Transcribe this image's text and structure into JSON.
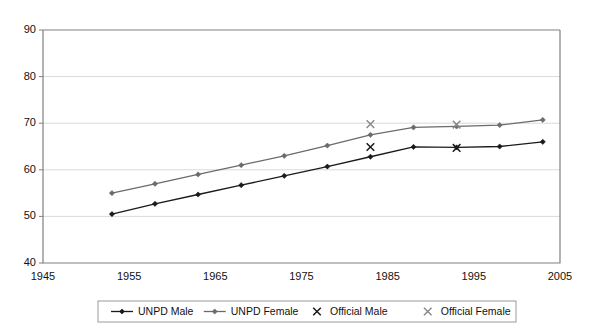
{
  "chart_data": {
    "type": "line",
    "title": "",
    "subtitle": "",
    "xlabel": "",
    "ylabel": "",
    "xlim": [
      1945,
      2005
    ],
    "ylim": [
      40,
      90
    ],
    "xticks": [
      1945,
      1955,
      1965,
      1975,
      1985,
      1995,
      2005
    ],
    "yticks": [
      40,
      50,
      60,
      70,
      80,
      90
    ],
    "grid": "horizontal",
    "legend_position": "bottom",
    "series": [
      {
        "name": "UNPD Male",
        "marker": "diamond",
        "color": "#1a1a1a",
        "style": "line+marker",
        "x": [
          1953,
          1958,
          1963,
          1968,
          1973,
          1978,
          1983,
          1988,
          1993,
          1998,
          2003
        ],
        "values": [
          50.5,
          52.7,
          54.7,
          56.7,
          58.7,
          60.7,
          62.8,
          64.9,
          64.8,
          65.0,
          66.0
        ]
      },
      {
        "name": "UNPD Female",
        "marker": "diamond",
        "color": "#6b6b6b",
        "style": "line+marker",
        "x": [
          1953,
          1958,
          1963,
          1968,
          1973,
          1978,
          1983,
          1988,
          1993,
          1998,
          2003
        ],
        "values": [
          55.0,
          57.0,
          59.0,
          61.0,
          63.0,
          65.2,
          67.5,
          69.1,
          69.3,
          69.6,
          70.7
        ]
      },
      {
        "name": "Official Male",
        "marker": "x",
        "color": "#1a1a1a",
        "style": "marker-only",
        "x": [
          1983,
          1993
        ],
        "values": [
          64.9,
          64.7
        ]
      },
      {
        "name": "Official Female",
        "marker": "x",
        "color": "#8a8a8a",
        "style": "marker-only",
        "x": [
          1983,
          1993
        ],
        "values": [
          69.8,
          69.7
        ]
      }
    ],
    "legend": [
      {
        "label": "UNPD Male",
        "marker": "line-diamond",
        "color": "#1a1a1a"
      },
      {
        "label": "UNPD Female",
        "marker": "line-diamond",
        "color": "#6b6b6b"
      },
      {
        "label": "Official Male",
        "marker": "x",
        "color": "#1a1a1a"
      },
      {
        "label": "Official Female",
        "marker": "x",
        "color": "#8a8a8a"
      }
    ]
  },
  "axes": {
    "y_tick_labels": [
      "90",
      "80",
      "70",
      "60",
      "50",
      "40"
    ],
    "x_tick_labels": [
      "1945",
      "1955",
      "1965",
      "1975",
      "1985",
      "1995",
      "2005"
    ]
  },
  "legend_labels": {
    "unpd_male": "UNPD Male",
    "unpd_female": "UNPD Female",
    "official_male": "Official Male",
    "official_female": "Official Female"
  }
}
